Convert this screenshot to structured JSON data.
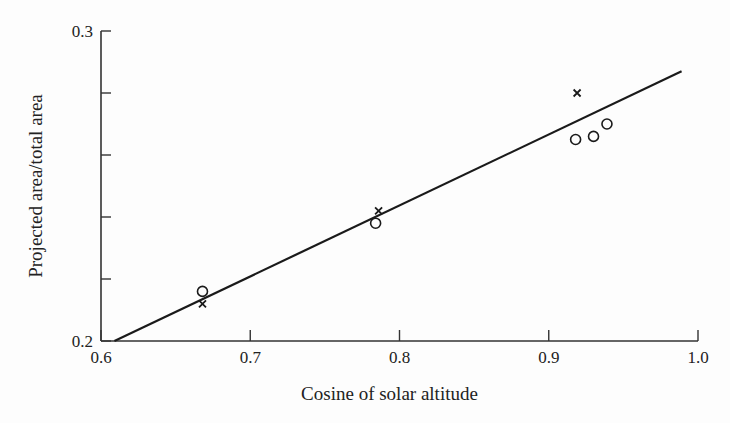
{
  "chart_data": {
    "type": "scatter",
    "title": "",
    "xlabel": "Cosine of solar altitude",
    "ylabel": "Projected area/total area",
    "xlim": [
      0.6,
      1.0
    ],
    "ylim": [
      0.2,
      0.3
    ],
    "x_ticks": [
      0.6,
      0.7,
      0.8,
      0.9,
      1.0
    ],
    "x_tick_labels": [
      "0.6",
      "0.7",
      "0.8",
      "0.9",
      "1.0"
    ],
    "y_ticks": [
      0.2,
      0.22,
      0.24,
      0.26,
      0.28,
      0.3
    ],
    "y_tick_labels": [
      "0.2",
      "",
      "",
      "",
      "",
      "0.3"
    ],
    "grid": false,
    "series": [
      {
        "name": "circles",
        "marker": "o",
        "points": [
          {
            "x": 0.668,
            "y": 0.216
          },
          {
            "x": 0.784,
            "y": 0.238
          },
          {
            "x": 0.918,
            "y": 0.265
          },
          {
            "x": 0.93,
            "y": 0.266
          },
          {
            "x": 0.939,
            "y": 0.27
          }
        ]
      },
      {
        "name": "crosses",
        "marker": "x",
        "points": [
          {
            "x": 0.668,
            "y": 0.212
          },
          {
            "x": 0.786,
            "y": 0.242
          },
          {
            "x": 0.919,
            "y": 0.28
          }
        ]
      },
      {
        "name": "fit-line",
        "marker": "line",
        "points": [
          {
            "x": 0.609,
            "y": 0.2
          },
          {
            "x": 0.989,
            "y": 0.287
          }
        ]
      }
    ]
  }
}
